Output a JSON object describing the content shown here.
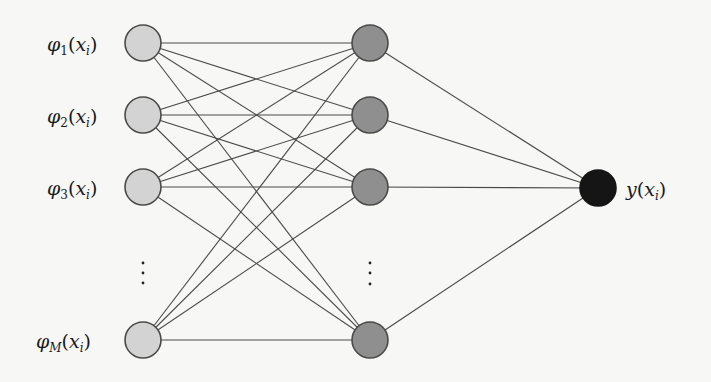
{
  "diagram": {
    "type": "neural-network",
    "colors": {
      "background": "#f7f7f5",
      "edge": "#4a4a4a",
      "input_fill": "#d3d3d3",
      "hidden_fill": "#8f8f8f",
      "output_fill": "#151515"
    },
    "input_layer": {
      "nodes": [
        {
          "label_base": "φ",
          "label_sub": "1",
          "label_arg": "x",
          "label_arg_sub": "i",
          "cx": 143,
          "cy": 43
        },
        {
          "label_base": "φ",
          "label_sub": "2",
          "label_arg": "x",
          "label_arg_sub": "i",
          "cx": 143,
          "cy": 115
        },
        {
          "label_base": "φ",
          "label_sub": "3",
          "label_arg": "x",
          "label_arg_sub": "i",
          "cx": 143,
          "cy": 187
        },
        {
          "label_base": "φ",
          "label_sub": "M",
          "label_arg": "x",
          "label_arg_sub": "i",
          "cx": 143,
          "cy": 340
        }
      ],
      "ellipsis": {
        "x": 143,
        "ys": [
          263,
          273,
          283
        ]
      }
    },
    "hidden_layer": {
      "nodes": [
        {
          "cx": 370,
          "cy": 43
        },
        {
          "cx": 370,
          "cy": 115
        },
        {
          "cx": 370,
          "cy": 187
        },
        {
          "cx": 370,
          "cy": 340
        }
      ],
      "ellipsis": {
        "x": 370,
        "ys": [
          263,
          273,
          284
        ]
      }
    },
    "output_layer": {
      "nodes": [
        {
          "label_base": "y",
          "label_arg": "x",
          "label_arg_sub": "i",
          "cx": 598,
          "cy": 188
        }
      ]
    },
    "node_radius": 18,
    "connectivity": "fully-connected"
  }
}
